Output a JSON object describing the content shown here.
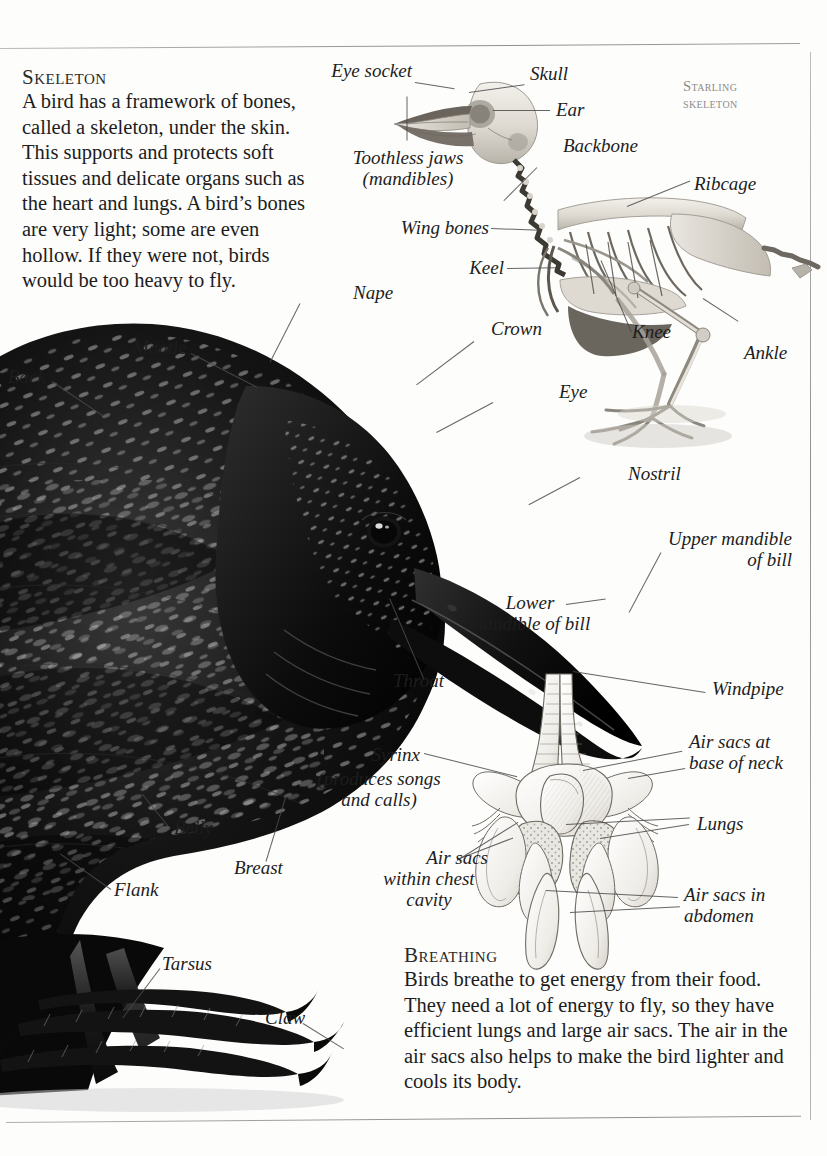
{
  "page": {
    "corner_note_line1": "Starling",
    "corner_note_line2": "skeleton"
  },
  "sections": [
    {
      "id": "skeleton",
      "heading": "Skeleton",
      "body": "A bird has a framework of bones, called a skeleton, under the skin. This supports and protects soft tissues and delicate organs such as the heart and lungs. A bird’s bones are very light; some are even hollow. If they were not, birds would be too heavy to fly."
    },
    {
      "id": "breathing",
      "heading": "Breathing",
      "body": "Birds breathe to get energy from their food. They need a lot of energy to fly, so they have efficient lungs and large air sacs. The air in the air sacs also helps to make the bird lighter and cools its body."
    }
  ],
  "skeleton_labels": {
    "eye_socket": "Eye socket",
    "skull": "Skull",
    "ear": "Ear",
    "toothless_jaws_l1": "Toothless jaws",
    "toothless_jaws_l2": "(mandibles)",
    "backbone": "Backbone",
    "ribcage": "Ribcage",
    "wing_bones": "Wing bones",
    "keel": "Keel",
    "knee": "Knee",
    "ankle": "Ankle"
  },
  "bird_labels": {
    "back": "Back",
    "mantle": "Mantle",
    "nape": "Nape",
    "crown": "Crown",
    "eye": "Eye",
    "nostril": "Nostril",
    "upper_mandible_l1": "Upper mandible",
    "upper_mandible_l2": "of bill",
    "lower_mandible_l1": "Lower",
    "lower_mandible_l2": "mandible of bill",
    "throat": "Throat",
    "breast": "Breast",
    "belly": "Belly",
    "flank": "Flank",
    "tarsus": "Tarsus",
    "claw": "Claw"
  },
  "respiratory_labels": {
    "windpipe": "Windpipe",
    "air_sacs_neck_l1": "Air sacs at",
    "air_sacs_neck_l2": "base of neck",
    "syrinx": "Syrinx",
    "syrinx_note_l1": "(produces songs",
    "syrinx_note_l2": "and calls)",
    "lungs": "Lungs",
    "air_sacs_chest_l1": "Air sacs",
    "air_sacs_chest_l2": "within chest",
    "air_sacs_chest_l3": "cavity",
    "air_sacs_abdomen_l1": "Air sacs in",
    "air_sacs_abdomen_l2": "abdomen"
  },
  "colors": {
    "ink": "#1c1c1c",
    "rule": "#9a9a9a",
    "note_gray": "#8b8b8b",
    "plumage_dark": "#0a0a0a",
    "plumage_speck": "#cfcfcf",
    "bone_light": "#e6e4df",
    "bone_shade": "#b4b0a8"
  }
}
